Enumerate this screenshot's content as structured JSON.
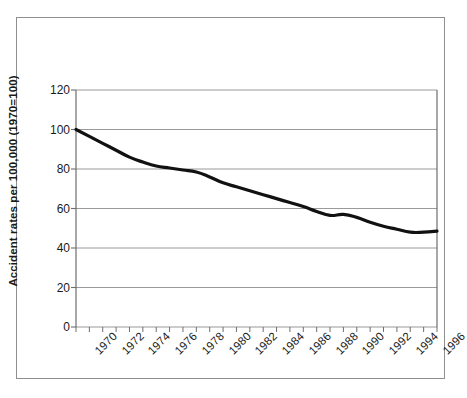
{
  "figure": {
    "border_color": "#8f8f8f",
    "background": "#ffffff"
  },
  "axes": {
    "y_title": "Accident rates per 100,000 (1970=100)",
    "x_title": "",
    "y_ticks": [
      0,
      20,
      40,
      60,
      80,
      100,
      120
    ],
    "x_tick_labels": [
      "1970",
      "1972",
      "1974",
      "1976",
      "1978",
      "1980",
      "1982",
      "1984",
      "1986",
      "1988",
      "1990",
      "1992",
      "1994",
      "1996"
    ],
    "grid_color": "#9a9a9a",
    "axis_color": "#6e6e6e",
    "line_color": "#111111"
  },
  "chart_data": {
    "type": "line",
    "title": "",
    "subtitle": "",
    "xlabel": "",
    "ylabel": "Accident rates per 100,000 (1970=100)",
    "xlim": [
      1970,
      1997
    ],
    "ylim": [
      0,
      120
    ],
    "grid": true,
    "grid_axis": "y",
    "legend": false,
    "legend_position": "none",
    "x": [
      1970,
      1971,
      1972,
      1973,
      1974,
      1975,
      1976,
      1977,
      1978,
      1979,
      1980,
      1981,
      1982,
      1983,
      1984,
      1985,
      1986,
      1987,
      1988,
      1989,
      1990,
      1991,
      1992,
      1993,
      1994,
      1995,
      1996,
      1997
    ],
    "series": [
      {
        "name": "Accident rate index",
        "values": [
          100,
          96.5,
          93,
          89.5,
          86,
          83.5,
          81.5,
          80.5,
          79.5,
          78.5,
          76,
          73,
          71,
          69,
          67,
          65,
          63,
          61,
          58.5,
          56.5,
          57,
          55.5,
          53,
          51,
          49.5,
          48,
          48,
          48.5
        ]
      }
    ],
    "x_tick_step": 1,
    "x_label_step": 2,
    "y_tick_step": 20
  }
}
